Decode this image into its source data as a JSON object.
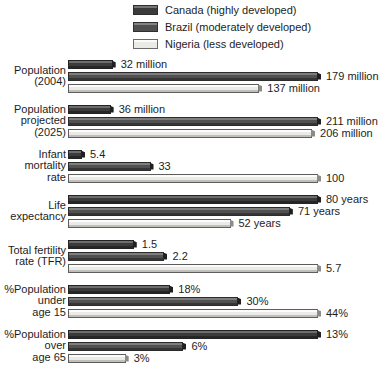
{
  "legend": {
    "position": "top-right",
    "items": [
      {
        "label": "Canada (highly developed)",
        "key": "canada",
        "color": "#3b3b3b"
      },
      {
        "label": "Brazil (moderately developed)",
        "key": "brazil",
        "color": "#515151"
      },
      {
        "label": "Nigeria (less developed)",
        "key": "nigeria",
        "color": "#eceae6"
      }
    ]
  },
  "chart_data": {
    "type": "bar",
    "orientation": "horizontal",
    "title": "",
    "xlabel": "",
    "ylabel": "",
    "grid": false,
    "legend_position": "top-right",
    "note": "Each indicator group is scaled independently to its own maximum; no shared x-axis.",
    "series": [
      {
        "name": "Canada (highly developed)",
        "values": [
          32,
          36,
          5.4,
          80,
          1.5,
          18,
          13
        ]
      },
      {
        "name": "Brazil (moderately developed)",
        "values": [
          179,
          211,
          33,
          71,
          2.2,
          30,
          6
        ]
      },
      {
        "name": "Nigeria (less developed)",
        "values": [
          137,
          206,
          100,
          52,
          5.7,
          44,
          3
        ]
      }
    ],
    "categories": [
      "Population (2004)",
      "Population projected (2025)",
      "Infant mortality rate",
      "Life expectancy",
      "Total fertility rate (TFR)",
      "%Population under age 15",
      "%Population over age 65"
    ],
    "groups": [
      {
        "label_lines": [
          "Population",
          "(2004)"
        ],
        "max": 179,
        "bars": [
          {
            "series": "canada",
            "value": 32,
            "value_label": "32 million"
          },
          {
            "series": "brazil",
            "value": 179,
            "value_label": "179 million"
          },
          {
            "series": "nigeria",
            "value": 137,
            "value_label": "137 million"
          }
        ]
      },
      {
        "label_lines": [
          "Population",
          "projected",
          "(2025)"
        ],
        "max": 211,
        "bars": [
          {
            "series": "canada",
            "value": 36,
            "value_label": "36 million"
          },
          {
            "series": "brazil",
            "value": 211,
            "value_label": "211 million"
          },
          {
            "series": "nigeria",
            "value": 206,
            "value_label": "206 million"
          }
        ]
      },
      {
        "label_lines": [
          "Infant",
          "mortality",
          "rate"
        ],
        "max": 100,
        "bars": [
          {
            "series": "canada",
            "value": 5.4,
            "value_label": "5.4"
          },
          {
            "series": "brazil",
            "value": 33,
            "value_label": "33"
          },
          {
            "series": "nigeria",
            "value": 100,
            "value_label": "100"
          }
        ]
      },
      {
        "label_lines": [
          "Life",
          "expectancy"
        ],
        "max": 80,
        "bars": [
          {
            "series": "canada",
            "value": 80,
            "value_label": "80 years"
          },
          {
            "series": "brazil",
            "value": 71,
            "value_label": "71 years"
          },
          {
            "series": "nigeria",
            "value": 52,
            "value_label": "52 years"
          }
        ]
      },
      {
        "label_lines": [
          "Total fertility",
          "rate (TFR)"
        ],
        "max": 5.7,
        "bars": [
          {
            "series": "canada",
            "value": 1.5,
            "value_label": "1.5"
          },
          {
            "series": "brazil",
            "value": 2.2,
            "value_label": "2.2"
          },
          {
            "series": "nigeria",
            "value": 5.7,
            "value_label": "5.7"
          }
        ]
      },
      {
        "label_lines": [
          "%Population",
          "under",
          "age 15"
        ],
        "max": 44,
        "bars": [
          {
            "series": "canada",
            "value": 18,
            "value_label": "18%"
          },
          {
            "series": "brazil",
            "value": 30,
            "value_label": "30%"
          },
          {
            "series": "nigeria",
            "value": 44,
            "value_label": "44%"
          }
        ]
      },
      {
        "label_lines": [
          "%Population",
          "over",
          "age 65"
        ],
        "max": 13,
        "bars": [
          {
            "series": "canada",
            "value": 13,
            "value_label": "13%"
          },
          {
            "series": "brazil",
            "value": 6,
            "value_label": "6%"
          },
          {
            "series": "nigeria",
            "value": 3,
            "value_label": "3%"
          }
        ]
      }
    ]
  }
}
